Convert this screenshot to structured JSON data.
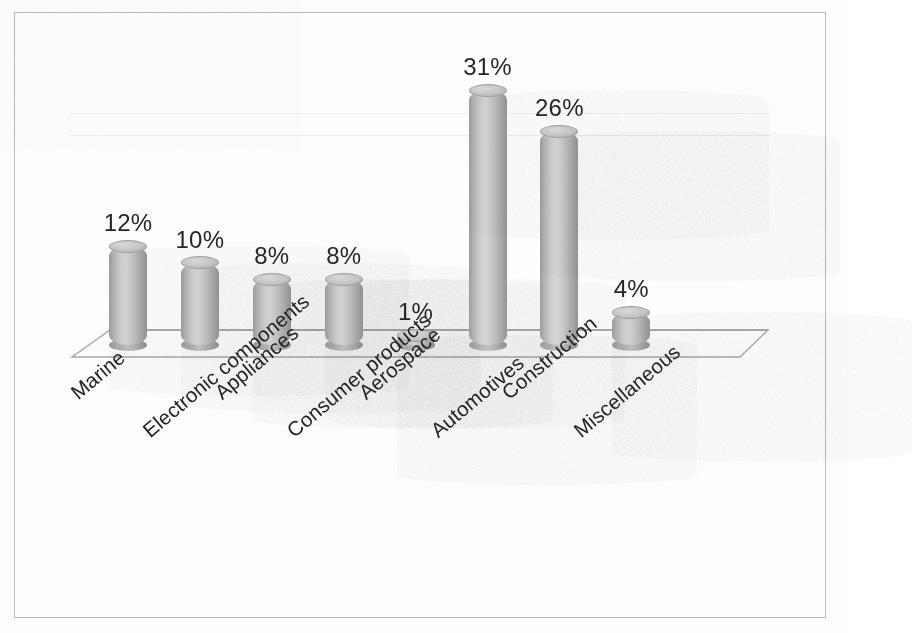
{
  "chart_data": {
    "type": "bar",
    "title": "",
    "subtitle": "",
    "xlabel": "",
    "ylabel": "",
    "grid": true,
    "legend": "none",
    "style": "3d-cylinder",
    "value_suffix": "%",
    "ylim": [
      0,
      35
    ],
    "categories": [
      "Marine",
      "Electronic components",
      "Appliances",
      "Consumer products",
      "Aerospace",
      "Automotives",
      "Construction",
      "Miscellaneous"
    ],
    "values": [
      12,
      10,
      8,
      8,
      1,
      31,
      26,
      4
    ],
    "data_labels": [
      "12%",
      "10%",
      "8%",
      "8%",
      "1%",
      "31%",
      "26%",
      "4%"
    ],
    "colors": {
      "bar_light": "#d6d6d6",
      "bar_mid": "#bdbdbd",
      "bar_dark": "#949494",
      "floor_line": "#a8a8a8",
      "gridline": "#ededed",
      "text": "#242424",
      "frame": "#b9b9b9",
      "background": "#fdfdfd"
    }
  },
  "bars": [
    {
      "label": "Marine",
      "value_text": "12%",
      "value": 12
    },
    {
      "label": "Electronic components",
      "value_text": "10%",
      "value": 10
    },
    {
      "label": "Appliances",
      "value_text": "8%",
      "value": 8
    },
    {
      "label": "Consumer products",
      "value_text": "8%",
      "value": 8
    },
    {
      "label": "Aerospace",
      "value_text": "1%",
      "value": 1
    },
    {
      "label": "Automotives",
      "value_text": "31%",
      "value": 31
    },
    {
      "label": "Construction",
      "value_text": "26%",
      "value": 26
    },
    {
      "label": "Miscellaneous",
      "value_text": "4%",
      "value": 4
    }
  ]
}
